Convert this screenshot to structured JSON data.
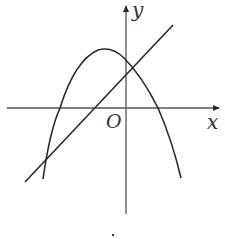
{
  "figure": {
    "axes": {
      "x_label": "x",
      "y_label": "y",
      "origin_label": "O"
    },
    "curves": [
      {
        "name": "parabola",
        "shape": "downward-opening parabola",
        "vertex_approx": "left of y-axis, above x-axis"
      },
      {
        "name": "line",
        "shape": "increasing straight line",
        "y_intercept": "positive"
      }
    ],
    "caption_mark": "."
  },
  "colors": {
    "stroke": "#2a2a2a",
    "background": "#ffffff"
  }
}
